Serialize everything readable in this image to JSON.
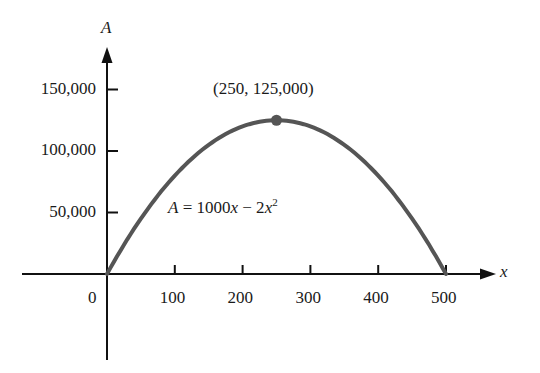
{
  "chart_data": {
    "type": "line",
    "title": "",
    "equation": "A = 1000x − 2x²",
    "xlabel": "x",
    "ylabel": "A",
    "x_ticks": [
      100,
      200,
      300,
      400,
      500
    ],
    "x_tick_labels": [
      "100",
      "200",
      "300",
      "400",
      "500"
    ],
    "y_ticks": [
      50000,
      100000,
      150000
    ],
    "y_tick_labels": [
      "50,000",
      "100,000",
      "150,000"
    ],
    "origin_label": "0",
    "xlim": [
      -150,
      560
    ],
    "ylim": [
      -70000,
      190000
    ],
    "grid": false,
    "series": [
      {
        "name": "A = 1000x − 2x²",
        "x": [
          0,
          50,
          100,
          150,
          200,
          250,
          300,
          350,
          400,
          450,
          500
        ],
        "y": [
          0,
          45000,
          80000,
          105000,
          120000,
          125000,
          120000,
          105000,
          80000,
          45000,
          0
        ]
      }
    ],
    "annotations": [
      {
        "text": "(250, 125,000)",
        "x": 250,
        "y": 125000,
        "marker": "point"
      },
      {
        "text": "A = 1000x − 2x²",
        "x": 110,
        "y": 55000
      }
    ]
  },
  "labels": {
    "y_axis": "A",
    "x_axis": "x",
    "origin": "0",
    "peak": "(250, 125,000)",
    "eq_A": "A",
    "eq_mid": " = 1000",
    "eq_x": "x",
    "eq_minus": " − 2",
    "eq_x2": "x",
    "eq_sup": "2"
  },
  "colors": {
    "axis": "#111111",
    "curve": "#555555",
    "text": "#1a1a1a"
  }
}
